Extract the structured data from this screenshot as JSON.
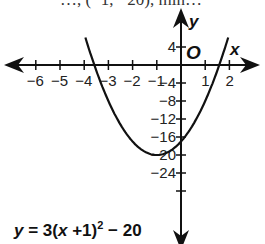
{
  "top_text": "…, (−1, −20), min…",
  "chart_data": {
    "type": "line",
    "title": "",
    "equation": "y = 3(x + 1)^2 - 20",
    "xlabel": "x",
    "ylabel": "y",
    "origin_label": "O",
    "x_ticks": [
      -6,
      -5,
      -4,
      -3,
      -2,
      -1,
      1,
      2
    ],
    "y_ticks": [
      4,
      -4,
      -8,
      -12,
      -16,
      -20,
      -24
    ],
    "xlim": [
      -6.5,
      2.5
    ],
    "ylim": [
      -28,
      10
    ],
    "vertex": [
      -1,
      -20
    ],
    "y_intercept": [
      0,
      -17
    ],
    "x_intercepts": [
      -3.58,
      1.58
    ],
    "series": [
      {
        "name": "y = 3(x+1)^2 - 20",
        "x": [
          -3.8,
          -3.5,
          -3,
          -2.5,
          -2,
          -1.5,
          -1,
          -0.5,
          0,
          0.5,
          1,
          1.5,
          1.8
        ],
        "values": [
          3.52,
          -1.25,
          -8,
          -13.25,
          -17,
          -19.25,
          -20,
          -19.25,
          -17,
          -13.25,
          -8,
          -1.25,
          3.52
        ]
      }
    ],
    "grid": false
  },
  "equation_parts": {
    "y": "y",
    "eq": " = 3(",
    "x": "x",
    "rest": " +1)",
    "sup": "2",
    "tail": " − 20"
  }
}
